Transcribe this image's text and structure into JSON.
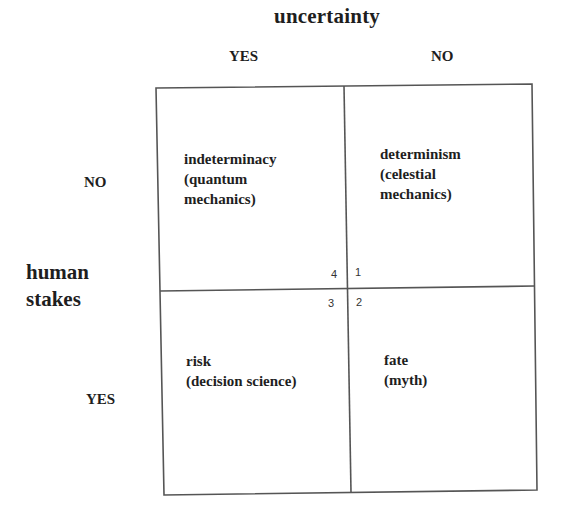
{
  "diagram": {
    "top_axis": {
      "title": "uncertainty",
      "columns": [
        "YES",
        "NO"
      ]
    },
    "left_axis": {
      "title_line1": "human",
      "title_line2": "stakes",
      "rows": [
        "NO",
        "YES"
      ]
    },
    "cells": [
      {
        "position": "top-left",
        "text": "indeterminacy\n(quantum\nmechanics)",
        "number": "4"
      },
      {
        "position": "top-right",
        "text": "determinism\n(celestial\nmechanics)",
        "number": "1"
      },
      {
        "position": "bottom-left",
        "text": "risk\n(decision science)",
        "number": "3"
      },
      {
        "position": "bottom-right",
        "text": "fate\n(myth)",
        "number": "2"
      }
    ],
    "line_color": "#555555"
  }
}
